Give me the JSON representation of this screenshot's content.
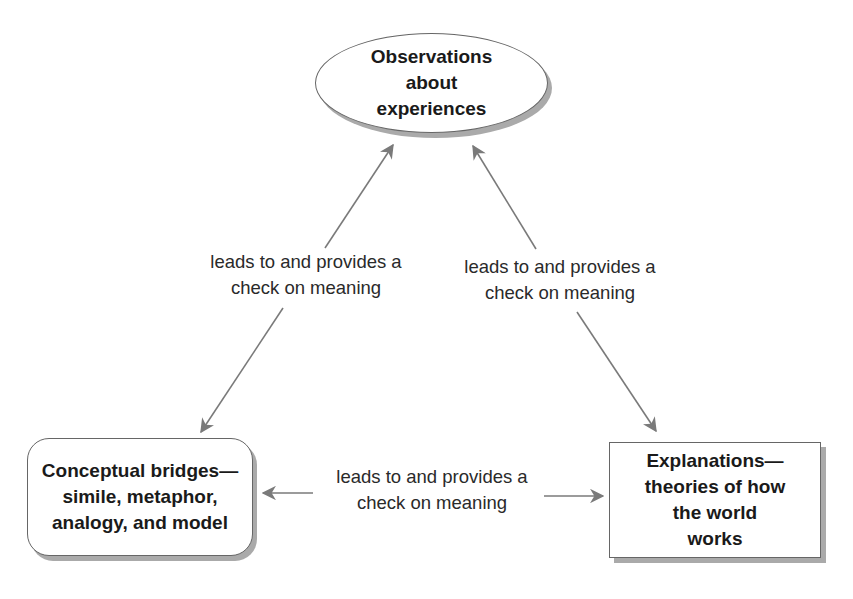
{
  "nodes": {
    "observations": {
      "lines": [
        "Observations",
        "about",
        "experiences"
      ],
      "shape": "ellipse"
    },
    "bridges": {
      "lines": [
        "Conceptual bridges—",
        "simile, metaphor,",
        "analogy, and model"
      ],
      "shape": "rounded-rectangle"
    },
    "explanations": {
      "lines": [
        "Explanations—",
        "theories of how",
        "the world",
        "works"
      ],
      "shape": "rectangle"
    }
  },
  "edges": {
    "left": {
      "lines": [
        "leads to and provides a",
        "check on meaning"
      ],
      "from": "bridges",
      "to": "observations",
      "bidirectional": true
    },
    "right": {
      "lines": [
        "leads to and provides a",
        "check on meaning"
      ],
      "from": "observations",
      "to": "explanations",
      "bidirectional": true
    },
    "bottom": {
      "lines": [
        "leads to and provides a",
        "check on meaning"
      ],
      "from": "bridges",
      "to": "explanations",
      "bidirectional": true
    }
  },
  "colors": {
    "arrow": "#7a7a7a",
    "border": "#666666",
    "shadow": "#aaaaaa",
    "text": "#1a1a1a"
  }
}
